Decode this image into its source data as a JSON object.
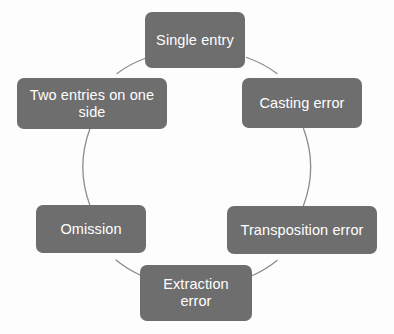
{
  "diagram": {
    "type": "cycle",
    "title": "",
    "shape": "circle",
    "colors": {
      "background": "#fdfdfd",
      "node_fill": "#6e6e6e",
      "node_text": "#ffffff",
      "circle_stroke": "#8c8c8c"
    },
    "circle": {
      "center_x": 197,
      "center_y": 167,
      "radius": 110,
      "stroke_width": 1.3
    },
    "nodes": [
      {
        "id": "single-entry",
        "label": "Single entry",
        "position": "top",
        "angle_deg": 90
      },
      {
        "id": "casting-error",
        "label": "Casting error",
        "position": "upper-right",
        "angle_deg": 30
      },
      {
        "id": "transposition-error",
        "label": "Transposition error",
        "position": "lower-right",
        "angle_deg": -30
      },
      {
        "id": "extraction-error",
        "label": "Extraction\nerror",
        "label_line1": "Extraction",
        "label_line2": "error",
        "position": "bottom",
        "angle_deg": -90
      },
      {
        "id": "omission",
        "label": "Omission",
        "position": "lower-left",
        "angle_deg": -150
      },
      {
        "id": "two-entries-on-one-side",
        "label": "Two entries on one side",
        "label_line1": "Two entries on one",
        "label_line2": "side",
        "position": "upper-left",
        "angle_deg": 150
      }
    ]
  }
}
